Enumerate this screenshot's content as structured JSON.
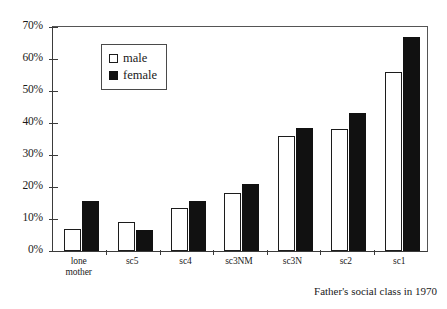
{
  "chart_data": {
    "type": "bar",
    "title": "",
    "subtitle": "",
    "xlabel": "Father's social class in 1970",
    "ylabel": "",
    "categories": [
      "lone\nmother",
      "sc5",
      "sc4",
      "sc3NM",
      "sc3N",
      "sc2",
      "sc1"
    ],
    "series": [
      {
        "name": "male",
        "color": "#ffffff",
        "edge_color": "#1c1c1c",
        "values": [
          7,
          9,
          13.5,
          18,
          36,
          38,
          56
        ]
      },
      {
        "name": "female",
        "color": "#111111",
        "edge_color": "#111111",
        "values": [
          15.5,
          6.5,
          15.5,
          21,
          38.5,
          43,
          67
        ]
      }
    ],
    "ylim": [
      0,
      70
    ],
    "ytick_values": [
      0,
      10,
      20,
      30,
      40,
      50,
      60,
      70
    ],
    "ytick_labels": [
      "0%",
      "10%",
      "20%",
      "30%",
      "40%",
      "50%",
      "60%",
      "70%"
    ],
    "grid": false,
    "legend_position": "upper left",
    "legend_entries": [
      "male",
      "female"
    ]
  },
  "legend": {
    "male_label": "male",
    "female_label": "female",
    "male_swatch": "hollow-square-icon",
    "female_swatch": "filled-square-icon"
  },
  "axes": {
    "x_title": "Father's social class in 1970"
  }
}
